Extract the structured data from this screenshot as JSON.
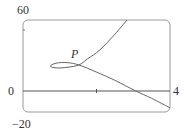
{
  "chart_data": {
    "type": "line",
    "title": "",
    "xlabel": "",
    "ylabel": "",
    "xlim": [
      0,
      4
    ],
    "ylim": [
      -20,
      60
    ],
    "grid": false,
    "tick_labels": {
      "y_top": "60",
      "y_bottom": "-20",
      "x_left": "0",
      "x_right": "4"
    },
    "annotations": [
      {
        "text": "P",
        "x": 1.52,
        "y": 22,
        "note": "self-intersection point of the curve"
      }
    ],
    "series": [
      {
        "name": "parametric curve",
        "points": [
          [
            2.83,
            60
          ],
          [
            2.5,
            48
          ],
          [
            2.1,
            35
          ],
          [
            1.75,
            27
          ],
          [
            1.52,
            22
          ],
          [
            1.2,
            20
          ],
          [
            0.9,
            19.5
          ],
          [
            0.74,
            21
          ],
          [
            0.9,
            23.5
          ],
          [
            1.2,
            24
          ],
          [
            1.52,
            22
          ],
          [
            2.0,
            16
          ],
          [
            2.5,
            9
          ],
          [
            3.07,
            0
          ],
          [
            3.5,
            -7
          ],
          [
            4.0,
            -16
          ]
        ]
      }
    ]
  },
  "labels": {
    "y_top": "60",
    "y_bottom": "−20",
    "x_left": "0",
    "x_right": "4",
    "point": "P"
  }
}
